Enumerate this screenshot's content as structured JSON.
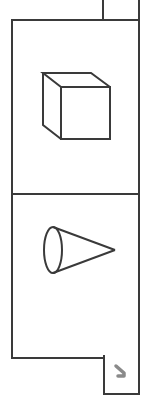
{
  "palette": {
    "title": "",
    "items": [
      {
        "id": "cube",
        "label": "",
        "icon": "cube-icon"
      },
      {
        "id": "cone",
        "label": "",
        "icon": "cone-icon"
      }
    ]
  },
  "resize_handle": {
    "icon": "resize-arrow-icon"
  },
  "colors": {
    "border": "#3a3a3a",
    "background": "#ffffff",
    "handle_arrow": "#8a8a8a"
  }
}
